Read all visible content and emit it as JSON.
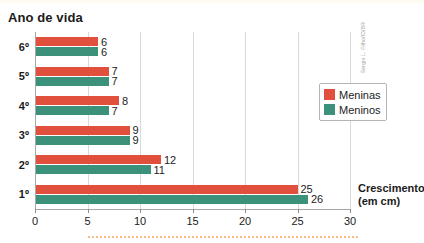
{
  "chart_data": {
    "type": "bar",
    "orientation": "horizontal",
    "title": "Ano de vida",
    "xlabel": "Crescimento (em cm)",
    "ylabel": "Ano de vida",
    "categories": [
      "1º",
      "2º",
      "3º",
      "4º",
      "5º",
      "6º"
    ],
    "series": [
      {
        "name": "Meninas",
        "color": "#e0503c",
        "values": [
          25,
          12,
          9,
          8,
          7,
          6
        ]
      },
      {
        "name": "Meninos",
        "color": "#3b9179",
        "values": [
          26,
          11,
          9,
          7,
          7,
          6
        ]
      }
    ],
    "xlim": [
      0,
      30
    ],
    "xticks": [
      0,
      5,
      10,
      15,
      20,
      25,
      30
    ],
    "xtick_labels": [
      "0",
      "5",
      "10",
      "15",
      "20",
      "25",
      "30"
    ],
    "grid": true,
    "grid_axis": "x",
    "legend_position": "right-upper"
  },
  "title": {
    "text": "Ano de vida"
  },
  "axis": {
    "x_title_line1": "Crescimento",
    "x_title_line2": "(em cm)",
    "ticks": [
      {
        "value": 0,
        "label": "0"
      },
      {
        "value": 5,
        "label": "5"
      },
      {
        "value": 10,
        "label": "10"
      },
      {
        "value": 15,
        "label": "15"
      },
      {
        "value": 20,
        "label": "20"
      },
      {
        "value": 25,
        "label": "25"
      },
      {
        "value": 30,
        "label": "30"
      }
    ]
  },
  "rows": [
    {
      "category": "6º",
      "meninas": {
        "value": 6,
        "label": "6"
      },
      "meninos": {
        "value": 6,
        "label": "6"
      }
    },
    {
      "category": "5º",
      "meninas": {
        "value": 7,
        "label": "7"
      },
      "meninos": {
        "value": 7,
        "label": "7"
      }
    },
    {
      "category": "4º",
      "meninas": {
        "value": 8,
        "label": "8"
      },
      "meninos": {
        "value": 7,
        "label": "7"
      }
    },
    {
      "category": "3º",
      "meninas": {
        "value": 9,
        "label": "9"
      },
      "meninos": {
        "value": 9,
        "label": "9"
      }
    },
    {
      "category": "2º",
      "meninas": {
        "value": 12,
        "label": "12"
      },
      "meninos": {
        "value": 11,
        "label": "11"
      }
    },
    {
      "category": "1º",
      "meninas": {
        "value": 25,
        "label": "25"
      },
      "meninos": {
        "value": 26,
        "label": "26"
      }
    }
  ],
  "legend": {
    "items": [
      {
        "label": "Meninas",
        "color": "#e0503c"
      },
      {
        "label": "Meninos",
        "color": "#3b9179"
      }
    ]
  },
  "credit": {
    "text": "Sergio L. Filho/ID/BR"
  },
  "colors": {
    "meninas": "#e0503c",
    "meninos": "#3b9179",
    "axis": "#a8a8a8",
    "grid": "#d9d9d9",
    "text": "#1b1b1b",
    "dotted_rule": "#f2a65a"
  }
}
